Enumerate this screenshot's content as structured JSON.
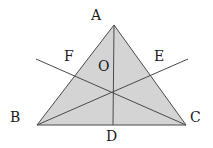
{
  "diagram": {
    "type": "triangle-with-cevians",
    "fill_color": "#d4d4d4",
    "stroke_color": "#4a4a4a",
    "text_color": "#1a1a1a",
    "points": {
      "A": {
        "x": 114,
        "y": 25
      },
      "B": {
        "x": 37,
        "y": 125
      },
      "C": {
        "x": 186,
        "y": 125
      },
      "D": {
        "x": 113,
        "y": 125
      },
      "center": {
        "x": 113,
        "y": 92
      },
      "F_ext": {
        "x": 36,
        "y": 59
      },
      "E_ext": {
        "x": 188,
        "y": 59
      }
    },
    "labels": {
      "A": "A",
      "B": "B",
      "C": "C",
      "D": "D",
      "E": "E",
      "F": "F",
      "O": "O"
    }
  }
}
